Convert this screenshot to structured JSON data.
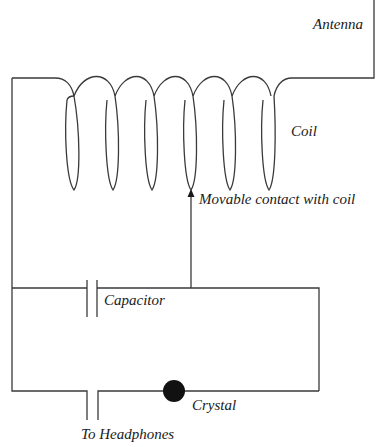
{
  "diagram": {
    "type": "circuit-schematic",
    "colors": {
      "wire": "#3a3a3a",
      "crystal": "#111111",
      "background": "#ffffff"
    },
    "components": [
      {
        "id": "antenna",
        "label": "Antenna"
      },
      {
        "id": "coil",
        "label": "Coil",
        "turns": 6
      },
      {
        "id": "contact",
        "label": "Movable contact with coil"
      },
      {
        "id": "capacitor",
        "label": "Capacitor"
      },
      {
        "id": "crystal",
        "label": "Crystal"
      },
      {
        "id": "headphones",
        "label": "To Headphones"
      }
    ]
  },
  "labels": {
    "antenna": "Antenna",
    "coil": "Coil",
    "contact": "Movable contact with coil",
    "capacitor": "Capacitor",
    "crystal": "Crystal",
    "headphones": "To Headphones"
  }
}
